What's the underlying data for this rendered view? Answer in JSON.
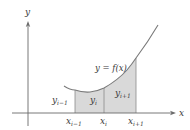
{
  "figure": {
    "axis_x_label": "x",
    "axis_y_label": "y",
    "curve_label": "y = f(x)",
    "strips": [
      {
        "height_label_base": "y",
        "height_label_sub": "i−1"
      },
      {
        "height_label_base": "y",
        "height_label_sub": "i"
      },
      {
        "height_label_base": "y",
        "height_label_sub": "i+1"
      }
    ],
    "ticks": [
      {
        "base": "x",
        "sub": "i−1"
      },
      {
        "base": "x",
        "sub": "i"
      },
      {
        "base": "x",
        "sub": "i+1"
      }
    ],
    "colors": {
      "axis": "#6a6a6a",
      "curve": "#7a7a7a",
      "shade": "#d9d9d9",
      "edge": "#8a8a8a"
    }
  }
}
